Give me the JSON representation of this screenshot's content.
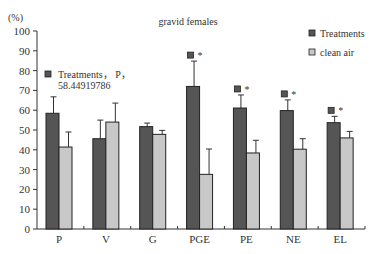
{
  "chart_data": {
    "type": "bar",
    "title": "gravid females",
    "ylabel": "(%)",
    "xlabel": "",
    "ylim": [
      0,
      100
    ],
    "yticks": [
      0,
      10,
      20,
      30,
      40,
      50,
      60,
      70,
      80,
      90,
      100
    ],
    "categories": [
      "P",
      "V",
      "G",
      "PGE",
      "PE",
      "NE",
      "EL"
    ],
    "series": [
      {
        "name": "Treatments",
        "color": "#555555",
        "values": [
          58.45,
          45.6,
          51.7,
          72.0,
          61.1,
          59.8,
          53.7
        ],
        "errors": [
          8.3,
          9.4,
          1.8,
          12.8,
          6.6,
          5.4,
          3.2
        ]
      },
      {
        "name": "clean air",
        "color": "#c8c8c8",
        "values": [
          41.4,
          54.0,
          47.8,
          27.6,
          38.4,
          40.3,
          46.0
        ],
        "errors": [
          7.6,
          9.6,
          2.0,
          12.8,
          6.4,
          5.3,
          3.3
        ]
      }
    ],
    "significance": [
      false,
      false,
      false,
      true,
      true,
      true,
      true
    ],
    "significance_marker": "*",
    "annotation": {
      "line1": "Treatments， P，",
      "line2": "58.44919786"
    },
    "legend_position": "top-right",
    "grid": false
  }
}
